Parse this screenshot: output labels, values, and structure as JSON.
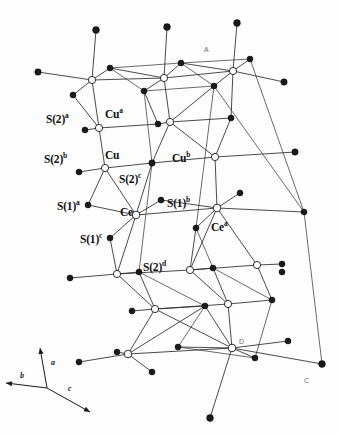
{
  "figure": {
    "domain_type": "crystal-structure-diagram",
    "background_color": "#fdfdfd",
    "line_color": "#2b2b2b",
    "filled_atom_color": "#1a1a1a",
    "open_atom_fill": "#ffffff"
  },
  "atom_labels": [
    {
      "id": "s2a",
      "base": "S(2)",
      "sup": "a",
      "x": 46,
      "y": 112
    },
    {
      "id": "cua",
      "base": "Cu",
      "sup": "a",
      "x": 105,
      "y": 107
    },
    {
      "id": "s2b",
      "base": "S(2)",
      "sup": "b",
      "x": 44,
      "y": 152
    },
    {
      "id": "cu",
      "base": "Cu",
      "sup": "",
      "x": 105,
      "y": 150
    },
    {
      "id": "cub",
      "base": "Cu",
      "sup": "b",
      "x": 172,
      "y": 151
    },
    {
      "id": "s2c",
      "base": "S(2)",
      "sup": "c",
      "x": 119,
      "y": 172
    },
    {
      "id": "s1a",
      "base": "S(1)",
      "sup": "a",
      "x": 57,
      "y": 199
    },
    {
      "id": "ce",
      "base": "Ce",
      "sup": "",
      "x": 120,
      "y": 207
    },
    {
      "id": "s1b",
      "base": "S(1)",
      "sup": "b",
      "x": 167,
      "y": 196
    },
    {
      "id": "s1c",
      "base": "S(1)",
      "sup": "c",
      "x": 80,
      "y": 232
    },
    {
      "id": "cea",
      "base": "Ce",
      "sup": "a",
      "x": 211,
      "y": 220
    },
    {
      "id": "s2d",
      "base": "S(2)",
      "sup": "d",
      "x": 143,
      "y": 260
    }
  ],
  "axis_triad": {
    "origin_x": 47,
    "origin_y": 388,
    "axes": [
      {
        "name": "a",
        "label": "a",
        "tip_x": 40,
        "tip_y": 348,
        "label_x": 51,
        "label_y": 358
      },
      {
        "name": "b",
        "label": "b",
        "tip_x": 6,
        "tip_y": 383,
        "label_x": 20,
        "label_y": 371
      },
      {
        "name": "c",
        "label": "c",
        "tip_x": 90,
        "tip_y": 412,
        "label_x": 68,
        "label_y": 384
      }
    ]
  },
  "corner_labels": [
    {
      "id": "A",
      "text": "A",
      "x": 204,
      "y": 46
    },
    {
      "id": "D",
      "text": "D",
      "x": 239,
      "y": 338
    },
    {
      "id": "C",
      "text": "C",
      "x": 304,
      "y": 377
    }
  ],
  "vertices": [
    {
      "id": "v0",
      "kind": "filled",
      "x": 96,
      "y": 30,
      "r": 3.4
    },
    {
      "id": "v1",
      "kind": "filled",
      "x": 167,
      "y": 27,
      "r": 3.4
    },
    {
      "id": "v2",
      "kind": "filled",
      "x": 237,
      "y": 23,
      "r": 3.4
    },
    {
      "id": "v3",
      "kind": "filled",
      "x": 38,
      "y": 72,
      "r": 3.2
    },
    {
      "id": "v4",
      "kind": "open",
      "x": 92,
      "y": 80,
      "r": 3.6
    },
    {
      "id": "v5",
      "kind": "filled",
      "x": 110,
      "y": 68,
      "r": 3.0
    },
    {
      "id": "v6",
      "kind": "filled",
      "x": 73,
      "y": 95,
      "r": 3.0
    },
    {
      "id": "v7",
      "kind": "open",
      "x": 164,
      "y": 78,
      "r": 3.6
    },
    {
      "id": "v8",
      "kind": "filled",
      "x": 181,
      "y": 63,
      "r": 3.0
    },
    {
      "id": "v9",
      "kind": "filled",
      "x": 144,
      "y": 91,
      "r": 3.0
    },
    {
      "id": "v10",
      "kind": "open",
      "x": 233,
      "y": 71,
      "r": 3.6
    },
    {
      "id": "v11",
      "kind": "filled",
      "x": 250,
      "y": 59,
      "r": 3.0
    },
    {
      "id": "v12",
      "kind": "filled",
      "x": 214,
      "y": 86,
      "r": 3.0
    },
    {
      "id": "v13",
      "kind": "filled",
      "x": 284,
      "y": 82,
      "r": 3.2
    },
    {
      "id": "v14",
      "kind": "open",
      "x": 99,
      "y": 128,
      "r": 3.6
    },
    {
      "id": "v15",
      "kind": "filled",
      "x": 85,
      "y": 130,
      "r": 3.0
    },
    {
      "id": "v16",
      "kind": "filled",
      "x": 158,
      "y": 124,
      "r": 3.0
    },
    {
      "id": "v17",
      "kind": "open",
      "x": 170,
      "y": 122,
      "r": 3.6
    },
    {
      "id": "v18",
      "kind": "filled",
      "x": 231,
      "y": 118,
      "r": 3.0
    },
    {
      "id": "v19",
      "kind": "open",
      "x": 105,
      "y": 168,
      "r": 3.6
    },
    {
      "id": "v20",
      "kind": "filled",
      "x": 79,
      "y": 172,
      "r": 3.0
    },
    {
      "id": "v21",
      "kind": "filled",
      "x": 152,
      "y": 163,
      "r": 3.2
    },
    {
      "id": "v22",
      "kind": "open",
      "x": 215,
      "y": 157,
      "r": 3.6
    },
    {
      "id": "v23",
      "kind": "filled",
      "x": 295,
      "y": 152,
      "r": 3.2
    },
    {
      "id": "v24",
      "kind": "filled",
      "x": 88,
      "y": 205,
      "r": 3.0
    },
    {
      "id": "v25",
      "kind": "open",
      "x": 136,
      "y": 215,
      "r": 3.8
    },
    {
      "id": "v26",
      "kind": "filled",
      "x": 161,
      "y": 200,
      "r": 3.0
    },
    {
      "id": "v27",
      "kind": "filled",
      "x": 110,
      "y": 238,
      "r": 3.0
    },
    {
      "id": "v28",
      "kind": "open",
      "x": 217,
      "y": 208,
      "r": 3.8
    },
    {
      "id": "v29",
      "kind": "filled",
      "x": 240,
      "y": 193,
      "r": 3.0
    },
    {
      "id": "v30",
      "kind": "filled",
      "x": 196,
      "y": 228,
      "r": 3.0
    },
    {
      "id": "v31",
      "kind": "filled",
      "x": 282,
      "y": 272,
      "r": 3.0
    },
    {
      "id": "v32",
      "kind": "filled",
      "x": 70,
      "y": 278,
      "r": 3.0
    },
    {
      "id": "v33",
      "kind": "open",
      "x": 117,
      "y": 274,
      "r": 3.6
    },
    {
      "id": "v34",
      "kind": "filled",
      "x": 139,
      "y": 272,
      "r": 3.0
    },
    {
      "id": "v35",
      "kind": "open",
      "x": 190,
      "y": 270,
      "r": 3.6
    },
    {
      "id": "v36",
      "kind": "filled",
      "x": 213,
      "y": 268,
      "r": 3.0
    },
    {
      "id": "v37",
      "kind": "open",
      "x": 257,
      "y": 265,
      "r": 3.6
    },
    {
      "id": "v38",
      "kind": "filled",
      "x": 282,
      "y": 264,
      "r": 3.0
    },
    {
      "id": "v39",
      "kind": "filled",
      "x": 132,
      "y": 311,
      "r": 3.0
    },
    {
      "id": "v40",
      "kind": "open",
      "x": 155,
      "y": 309,
      "r": 3.6
    },
    {
      "id": "v41",
      "kind": "filled",
      "x": 205,
      "y": 306,
      "r": 3.0
    },
    {
      "id": "v42",
      "kind": "open",
      "x": 228,
      "y": 304,
      "r": 3.6
    },
    {
      "id": "v43",
      "kind": "filled",
      "x": 272,
      "y": 300,
      "r": 3.0
    },
    {
      "id": "v44",
      "kind": "filled",
      "x": 178,
      "y": 347,
      "r": 3.0
    },
    {
      "id": "v45",
      "kind": "open",
      "x": 128,
      "y": 354,
      "r": 3.8
    },
    {
      "id": "v46",
      "kind": "filled",
      "x": 79,
      "y": 362,
      "r": 3.0
    },
    {
      "id": "v47",
      "kind": "filled",
      "x": 152,
      "y": 372,
      "r": 3.0
    },
    {
      "id": "v48",
      "kind": "open",
      "x": 232,
      "y": 348,
      "r": 3.8
    },
    {
      "id": "v49",
      "kind": "filled",
      "x": 288,
      "y": 341,
      "r": 3.0
    },
    {
      "id": "v50",
      "kind": "filled",
      "x": 255,
      "y": 358,
      "r": 3.0
    },
    {
      "id": "v51",
      "kind": "filled",
      "x": 210,
      "y": 418,
      "r": 3.4
    },
    {
      "id": "v52",
      "kind": "filled",
      "x": 322,
      "y": 364,
      "r": 3.4
    },
    {
      "id": "v53",
      "kind": "filled",
      "x": 117,
      "y": 352,
      "r": 3.0
    },
    {
      "id": "v54",
      "kind": "filled",
      "x": 304,
      "y": 212,
      "r": 3.0
    }
  ],
  "bonds": [
    [
      "v0",
      "v4"
    ],
    [
      "v1",
      "v7"
    ],
    [
      "v2",
      "v10"
    ],
    [
      "v3",
      "v4"
    ],
    [
      "v4",
      "v5"
    ],
    [
      "v4",
      "v6"
    ],
    [
      "v4",
      "v7"
    ],
    [
      "v4",
      "v14"
    ],
    [
      "v5",
      "v7"
    ],
    [
      "v6",
      "v14"
    ],
    [
      "v7",
      "v8"
    ],
    [
      "v7",
      "v9"
    ],
    [
      "v7",
      "v10"
    ],
    [
      "v7",
      "v17"
    ],
    [
      "v8",
      "v10"
    ],
    [
      "v9",
      "v16"
    ],
    [
      "v10",
      "v11"
    ],
    [
      "v10",
      "v12"
    ],
    [
      "v10",
      "v13"
    ],
    [
      "v10",
      "v18"
    ],
    [
      "v12",
      "v17"
    ],
    [
      "v14",
      "v15"
    ],
    [
      "v14",
      "v16"
    ],
    [
      "v14",
      "v19"
    ],
    [
      "v16",
      "v17"
    ],
    [
      "v17",
      "v18"
    ],
    [
      "v17",
      "v21"
    ],
    [
      "v17",
      "v22"
    ],
    [
      "v18",
      "v22"
    ],
    [
      "v19",
      "v20"
    ],
    [
      "v19",
      "v21"
    ],
    [
      "v19",
      "v24"
    ],
    [
      "v19",
      "v25"
    ],
    [
      "v21",
      "v22"
    ],
    [
      "v21",
      "v25"
    ],
    [
      "v22",
      "v23"
    ],
    [
      "v22",
      "v28"
    ],
    [
      "v24",
      "v25"
    ],
    [
      "v25",
      "v26"
    ],
    [
      "v25",
      "v27"
    ],
    [
      "v25",
      "v28"
    ],
    [
      "v25",
      "v33"
    ],
    [
      "v26",
      "v28"
    ],
    [
      "v27",
      "v33"
    ],
    [
      "v28",
      "v29"
    ],
    [
      "v28",
      "v30"
    ],
    [
      "v28",
      "v35"
    ],
    [
      "v28",
      "v37"
    ],
    [
      "v30",
      "v35"
    ],
    [
      "v28",
      "v54"
    ],
    [
      "v32",
      "v33"
    ],
    [
      "v33",
      "v34"
    ],
    [
      "v33",
      "v35"
    ],
    [
      "v33",
      "v40"
    ],
    [
      "v34",
      "v40"
    ],
    [
      "v35",
      "v36"
    ],
    [
      "v35",
      "v37"
    ],
    [
      "v35",
      "v42"
    ],
    [
      "v36",
      "v42"
    ],
    [
      "v37",
      "v38"
    ],
    [
      "v37",
      "v43"
    ],
    [
      "v39",
      "v40"
    ],
    [
      "v40",
      "v41"
    ],
    [
      "v40",
      "v42"
    ],
    [
      "v40",
      "v45"
    ],
    [
      "v41",
      "v45"
    ],
    [
      "v42",
      "v43"
    ],
    [
      "v42",
      "v48"
    ],
    [
      "v41",
      "v48"
    ],
    [
      "v45",
      "v46"
    ],
    [
      "v45",
      "v47"
    ],
    [
      "v45",
      "v48"
    ],
    [
      "v45",
      "v53"
    ],
    [
      "v44",
      "v48"
    ],
    [
      "v48",
      "v49"
    ],
    [
      "v48",
      "v50"
    ],
    [
      "v48",
      "v51"
    ],
    [
      "v48",
      "v52"
    ],
    [
      "v40",
      "v48"
    ]
  ],
  "cell_frame": [
    [
      "v5",
      "v9"
    ],
    [
      "v8",
      "v12"
    ],
    [
      "v11",
      "v54"
    ],
    [
      "v9",
      "v21"
    ],
    [
      "v12",
      "v30"
    ],
    [
      "v21",
      "v34"
    ],
    [
      "v30",
      "v36"
    ],
    [
      "v34",
      "v41"
    ],
    [
      "v36",
      "v43"
    ],
    [
      "v41",
      "v44"
    ],
    [
      "v43",
      "v50"
    ],
    [
      "v54",
      "v52"
    ],
    [
      "v44",
      "v50"
    ],
    [
      "v5",
      "v8"
    ],
    [
      "v8",
      "v11"
    ],
    [
      "v9",
      "v12"
    ],
    [
      "v12",
      "v54"
    ]
  ]
}
